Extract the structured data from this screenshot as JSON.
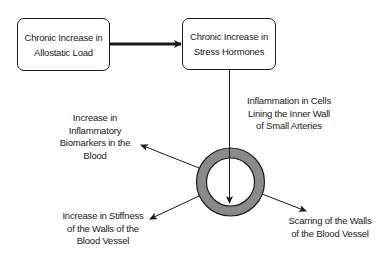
{
  "diagram": {
    "nodes": {
      "allostatic_load": {
        "text": "Chronic Increase in\nAllostatic Load"
      },
      "stress_hormones": {
        "text": "Chronic Increase in\nStress Hormones"
      }
    },
    "labels": {
      "inflammation_cells": "Inflammation in Cells\nLining the Inner Wall\nof Small Arteries",
      "inflammatory_biomarkers": "Increase in\nInflammatory\nBiomarkers in the\nBlood",
      "stiffness": "Increase in Stiffness\nof the Walls of the\nBlood Vessel",
      "scarring": "Scarring of the Walls\nof the Blood Vessel"
    },
    "vessel_icon": "blood-vessel-cross-section",
    "colors": {
      "stroke": "#1a1a1a",
      "vessel_wall": "#8a8a8a",
      "background": "#ffffff"
    }
  }
}
